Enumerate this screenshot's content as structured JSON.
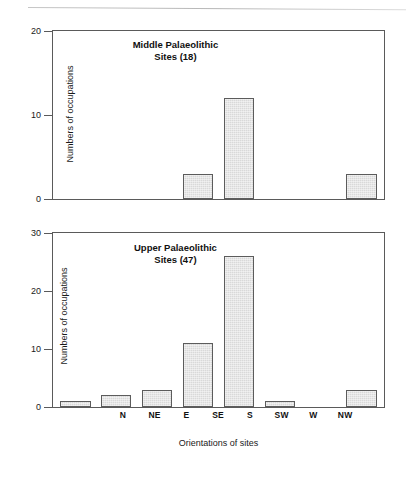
{
  "figure": {
    "background": "#ffffff",
    "bar_fill": "#d9d9d9",
    "bar_border": "#5c5c5c",
    "axis_color": "#5a5a5a",
    "xlabel": "Orientations of sites"
  },
  "chart_data": [
    {
      "type": "bar",
      "title": "Middle Palaeolithic",
      "subtitle": "Sites (18)",
      "categories": [
        "N",
        "NE",
        "E",
        "SE",
        "S",
        "SW",
        "W",
        "NW"
      ],
      "values": [
        0,
        0,
        0,
        3,
        12,
        0,
        0,
        3
      ],
      "xlabel": "",
      "ylabel": "Numbers of occupations",
      "ylim": [
        0,
        20
      ],
      "yticks": [
        0,
        10,
        20
      ],
      "grid": false,
      "legend": "none"
    },
    {
      "type": "bar",
      "title": "Upper Palaeolithic",
      "subtitle": "Sites (47)",
      "categories": [
        "N",
        "NE",
        "E",
        "SE",
        "S",
        "SW",
        "W",
        "NW"
      ],
      "values": [
        1,
        2,
        3,
        11,
        26,
        1,
        0,
        3
      ],
      "xlabel": "Orientations of sites",
      "ylabel": "Numbers of occupations",
      "ylim": [
        0,
        30
      ],
      "yticks": [
        0,
        10,
        20,
        30
      ],
      "grid": false,
      "legend": "none"
    }
  ]
}
